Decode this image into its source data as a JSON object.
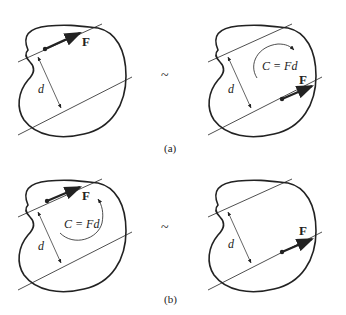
{
  "figure": {
    "equivalence_symbol": "~",
    "panels": [
      {
        "id": "a",
        "caption": "(a)",
        "left": {
          "force_label": "F",
          "distance_label": "d",
          "force_position": "top line"
        },
        "right": {
          "force_label": "F",
          "distance_label": "d",
          "couple_label": "C = Fd",
          "couple_direction": "clockwise",
          "force_position": "bottom line"
        }
      },
      {
        "id": "b",
        "caption": "(b)",
        "left": {
          "force_label": "F",
          "distance_label": "d",
          "couple_label": "C = Fd",
          "couple_direction": "counterclockwise",
          "force_position": "top line"
        },
        "right": {
          "force_label": "F",
          "distance_label": "d",
          "force_position": "bottom line"
        }
      }
    ]
  },
  "colors": {
    "stroke": "#222222",
    "background": "#ffffff"
  }
}
